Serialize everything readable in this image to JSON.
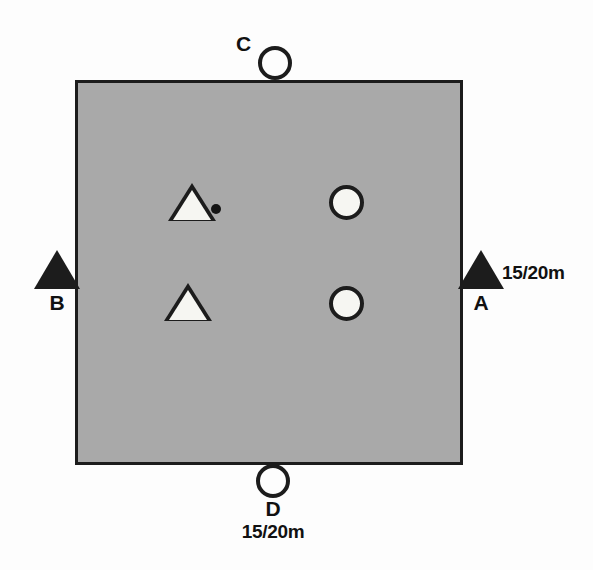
{
  "figure": {
    "type": "schematic-field-diagram",
    "background_color": "#fdfdfd",
    "field": {
      "name": "shaded-square-plot",
      "fill_color": "#a9a9a9",
      "border_color": "#1c1c1c"
    }
  },
  "boundary_markers": [
    {
      "id": "A",
      "label": "A",
      "shape": "triangle",
      "side": "right",
      "distance_label": "15/20m"
    },
    {
      "id": "B",
      "label": "B",
      "shape": "triangle",
      "side": "left",
      "distance_label": ""
    },
    {
      "id": "C",
      "label": "C",
      "shape": "circle",
      "side": "top",
      "distance_label": ""
    },
    {
      "id": "D",
      "label": "D",
      "shape": "circle",
      "side": "bottom",
      "distance_label": "15/20m"
    }
  ],
  "interior_markers": [
    {
      "shape": "triangle",
      "position": "upper-left",
      "fill": "white"
    },
    {
      "shape": "triangle",
      "position": "lower-left",
      "fill": "white"
    },
    {
      "shape": "circle",
      "position": "upper-right",
      "fill": "white"
    },
    {
      "shape": "circle",
      "position": "lower-right",
      "fill": "white"
    },
    {
      "shape": "dot",
      "position": "upper-centre-left",
      "fill": "black"
    }
  ],
  "distances": {
    "a_label": "15/20m",
    "d_label": "15/20m"
  }
}
